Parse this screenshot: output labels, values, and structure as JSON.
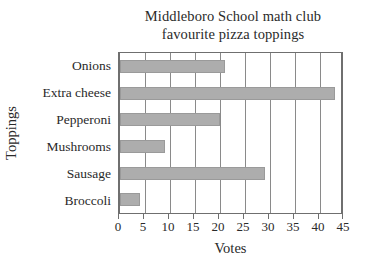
{
  "chart_data": {
    "type": "bar",
    "orientation": "horizontal",
    "title": "Middleboro School math club favourite pizza toppings",
    "title_lines": [
      "Middleboro School math club",
      "favourite pizza toppings"
    ],
    "xlabel": "Votes",
    "ylabel": "Toppings",
    "categories": [
      "Onions",
      "Extra cheese",
      "Pepperoni",
      "Mushrooms",
      "Sausage",
      "Broccoli"
    ],
    "values": [
      21,
      43,
      20,
      9,
      29,
      4
    ],
    "xlim": [
      0,
      45
    ],
    "xticks": [
      0,
      5,
      10,
      15,
      20,
      25,
      30,
      35,
      40,
      45
    ],
    "xtick_labels": [
      "0",
      "5",
      "10",
      "15",
      "20",
      "25",
      "30",
      "35",
      "40",
      "45"
    ],
    "grid": "vertical",
    "legend": "none",
    "bar_color": "#adadad",
    "bar_edge_color": "#9a9a9a",
    "axis_color": "#6f6f6f",
    "grid_color": "#8a8a8a",
    "background_color": "#ffffff",
    "text_color": "#2a2a2a"
  }
}
